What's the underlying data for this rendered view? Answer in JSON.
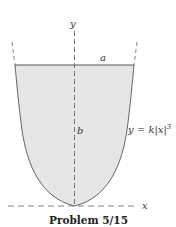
{
  "figure": {
    "caption": "Problem 5/15",
    "labels": {
      "y_axis": "y",
      "x_axis": "x",
      "width": "a",
      "height": "b",
      "equation_prefix": "y = k|x|",
      "equation_exponent": "3"
    },
    "colors": {
      "fill": "#e6e6e6",
      "stroke": "#555555",
      "dash": "#666666"
    }
  }
}
